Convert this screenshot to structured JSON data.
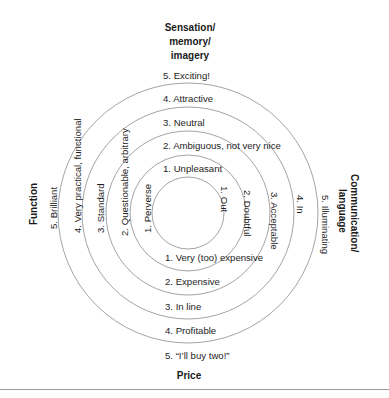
{
  "diagram": {
    "rings": [
      {
        "level": 1,
        "r": 36
      },
      {
        "level": 2,
        "r": 58
      },
      {
        "level": 3,
        "r": 82
      },
      {
        "level": 4,
        "r": 106
      },
      {
        "level": 5,
        "r": 130
      }
    ],
    "center": {
      "x": 188,
      "y": 213
    },
    "ring_color": "#8c8c8c",
    "axes": {
      "top": {
        "title_lines": [
          "Sensation/",
          "memory/",
          "imagery"
        ],
        "labels": [
          "5. Exciting!",
          "4. Attractive",
          "3. Neutral",
          "2. Ambiguous, not very nice",
          "1. Unpleasant"
        ]
      },
      "bottom": {
        "title": "Price",
        "labels": [
          "1. Very (too) expensive",
          "2. Expensive",
          "3. In line",
          "4. Profitable",
          "5. “I’ll buy two!”"
        ]
      },
      "left": {
        "title": "Function",
        "labels": [
          "5. Brilliant",
          "4. Very practical, functional",
          "3. Standard",
          "2. Questionable, arbitrary",
          "1. Perverse"
        ]
      },
      "right": {
        "title_lines": [
          "Communication/",
          "language"
        ],
        "labels": [
          "1. Out",
          "2. Doubtful",
          "3. Acceptable",
          "4. In",
          "5. Illuminating"
        ]
      }
    }
  }
}
